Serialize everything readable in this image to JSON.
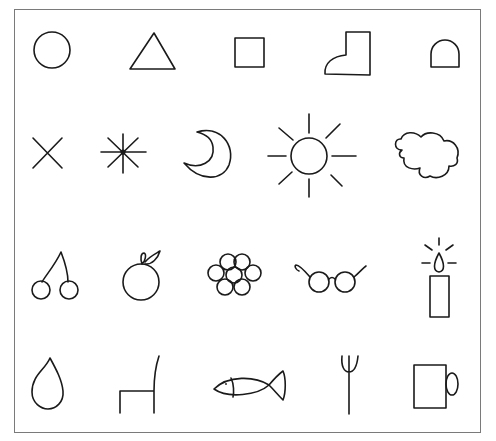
{
  "sheet": {
    "title": "Picture symbol sheet",
    "rows": [
      {
        "items": [
          {
            "name": "circle"
          },
          {
            "name": "triangle"
          },
          {
            "name": "square"
          },
          {
            "name": "boot"
          },
          {
            "name": "arch"
          }
        ]
      },
      {
        "items": [
          {
            "name": "cross"
          },
          {
            "name": "asterisk-star"
          },
          {
            "name": "crescent-moon"
          },
          {
            "name": "sun"
          },
          {
            "name": "cloud"
          }
        ]
      },
      {
        "items": [
          {
            "name": "cherries"
          },
          {
            "name": "apple"
          },
          {
            "name": "flower"
          },
          {
            "name": "glasses"
          },
          {
            "name": "candle"
          }
        ]
      },
      {
        "items": [
          {
            "name": "water-drop"
          },
          {
            "name": "chair"
          },
          {
            "name": "fish"
          },
          {
            "name": "fork"
          },
          {
            "name": "mug"
          }
        ]
      }
    ],
    "colors": {
      "stroke": "#1a1a1a",
      "frame": "#7a7a7a",
      "background": "#ffffff"
    }
  },
  "caption": {
    "text": ""
  }
}
